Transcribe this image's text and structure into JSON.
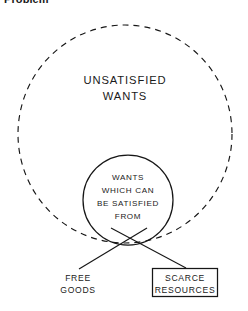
{
  "figure": {
    "caption": "Problem",
    "background_color": "#ffffff",
    "ink_color": "#161616",
    "outer_region": {
      "name": "unsatisfied-wants",
      "label_lines": [
        "UNSATISFIED",
        "WANTS"
      ],
      "border_style": "dashed",
      "shape": "circle"
    },
    "inner_region": {
      "name": "wants-which-can-be-satisfied-from",
      "label_lines": [
        "WANTS",
        "WHICH CAN",
        "BE SATISFIED",
        "FROM"
      ],
      "border_style": "solid",
      "shape": "circle"
    },
    "callouts": [
      {
        "name": "free-goods",
        "label_lines": [
          "FREE",
          "GOODS"
        ],
        "boxed": false
      },
      {
        "name": "scarce-resources",
        "label_lines": [
          "SCARCE",
          "RESOURCES"
        ],
        "boxed": true
      }
    ]
  }
}
